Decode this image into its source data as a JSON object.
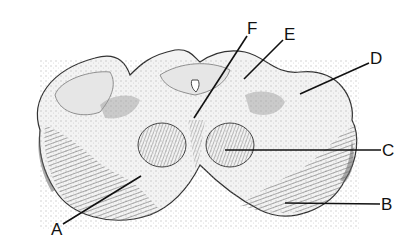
{
  "figure": {
    "background": "#ffffff",
    "ink": "#111111"
  },
  "labels": [
    {
      "id": "F",
      "text": "F",
      "x": 247,
      "y": 34,
      "line": [
        247,
        36,
        194,
        118
      ]
    },
    {
      "id": "E",
      "text": "E",
      "x": 284,
      "y": 40,
      "line": [
        283,
        40,
        244,
        79
      ]
    },
    {
      "id": "D",
      "text": "D",
      "x": 370,
      "y": 64,
      "line": [
        369,
        63,
        300,
        94
      ]
    },
    {
      "id": "C",
      "text": "C",
      "x": 382,
      "y": 156,
      "line": [
        381,
        150,
        225,
        150
      ]
    },
    {
      "id": "B",
      "text": "B",
      "x": 381,
      "y": 210,
      "line": [
        380,
        204,
        285,
        203
      ]
    },
    {
      "id": "A",
      "text": "A",
      "x": 51,
      "y": 235,
      "line": [
        63,
        224,
        141,
        176
      ]
    }
  ]
}
